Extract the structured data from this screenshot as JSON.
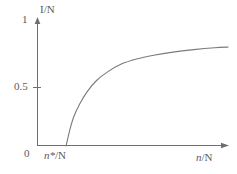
{
  "chart_data": {
    "type": "line",
    "title": "",
    "xlabel": "n/N",
    "ylabel": "I/N",
    "xlim": [
      0,
      1
    ],
    "ylim": [
      0,
      1
    ],
    "grid": false,
    "legend": null,
    "x_tick_labels": [
      "0",
      "n*/N"
    ],
    "y_tick_labels": [
      "0",
      "0.5",
      "1"
    ],
    "y_ticks": [
      0,
      0.5,
      1
    ],
    "annotations": [
      "n*/N"
    ],
    "series": [
      {
        "name": "infected fraction",
        "comment": "rises from zero at the epidemic threshold n*/N and saturates near 0.8",
        "x": [
          0.15,
          0.17,
          0.19,
          0.22,
          0.26,
          0.31,
          0.37,
          0.44,
          0.52,
          0.61,
          0.71,
          0.82,
          0.93,
          1.0
        ],
        "y": [
          0.0,
          0.13,
          0.23,
          0.33,
          0.43,
          0.52,
          0.59,
          0.65,
          0.69,
          0.72,
          0.745,
          0.765,
          0.78,
          0.785
        ]
      }
    ]
  },
  "labels": {
    "y_one": "1",
    "y_half": "0.5",
    "y_zero": "0",
    "y_axis_title": "I/N",
    "x_axis_title_italic": "n",
    "x_axis_title_rest": "/N",
    "x_threshold_italic": "n*",
    "x_threshold_rest": "/N"
  },
  "colors": {
    "background": "#ffffff",
    "axis": "#6e6e6e",
    "curve": "#7a7a7a",
    "text": "#5a5a5a"
  }
}
